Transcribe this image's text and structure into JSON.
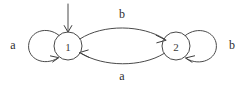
{
  "figure": {
    "background_color": "#ffffff",
    "stroke_color": "#4a4a4a",
    "text_color": "#2e2e2e",
    "width": 245,
    "height": 85
  },
  "states": [
    {
      "id": "state-1",
      "label": "1",
      "cx": 68,
      "cy": 46,
      "r": 14,
      "initial": true
    },
    {
      "id": "state-2",
      "label": "2",
      "cx": 176,
      "cy": 46,
      "r": 14,
      "initial": false
    }
  ],
  "transitions": [
    {
      "id": "loop-1-a",
      "from": "1",
      "to": "1",
      "label": "a",
      "kind": "self-loop",
      "side": "left",
      "label_x": 13,
      "label_y": 45
    },
    {
      "id": "edge-1-2-b",
      "from": "1",
      "to": "2",
      "label": "b",
      "kind": "curve",
      "side": "top",
      "label_x": 122,
      "label_y": 14
    },
    {
      "id": "edge-2-1-a",
      "from": "2",
      "to": "1",
      "label": "a",
      "kind": "curve",
      "side": "bottom",
      "label_x": 122,
      "label_y": 76
    },
    {
      "id": "loop-2-b",
      "from": "2",
      "to": "2",
      "label": "b",
      "kind": "self-loop",
      "side": "right",
      "label_x": 232,
      "label_y": 45
    }
  ],
  "start_arrow": {
    "id": "start-arrow",
    "label": "",
    "x": 68,
    "y_from": 4,
    "y_to": 31
  }
}
